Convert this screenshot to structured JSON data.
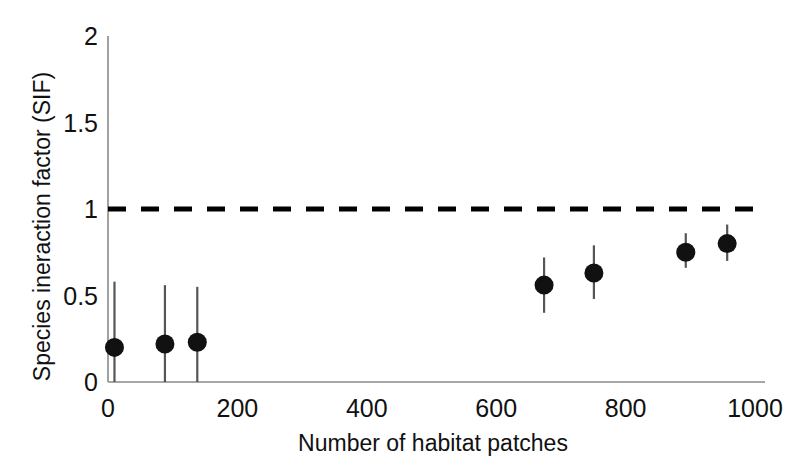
{
  "chart_data": {
    "type": "scatter",
    "title": "",
    "xlabel": "Number of habitat patches",
    "ylabel": "Species ineraction factor (SIF)",
    "xlim": [
      0,
      1000
    ],
    "ylim": [
      0,
      2
    ],
    "xticks": [
      0,
      200,
      400,
      600,
      800,
      1000
    ],
    "yticks": [
      0,
      0.5,
      1,
      1.5,
      2
    ],
    "xtick_labels": [
      "0",
      "200",
      "400",
      "600",
      "800",
      "1000"
    ],
    "ytick_labels": [
      "0",
      "0.5",
      "1",
      "1.5",
      "2"
    ],
    "grid": false,
    "legend": "none",
    "marker": "filled-circle",
    "marker_color": "#111111",
    "errorbar_color": "#555555",
    "axis_color": "#8a8a8a",
    "reference_line": {
      "label": "SIF = 1 (no interaction)",
      "orientation": "horizontal",
      "y": 1,
      "style": "dashed",
      "color": "#000000",
      "width": 5
    },
    "points": [
      {
        "x": 10,
        "y": 0.2,
        "y_low": 0.0,
        "y_high": 0.58
      },
      {
        "x": 88,
        "y": 0.22,
        "y_low": 0.0,
        "y_high": 0.56
      },
      {
        "x": 138,
        "y": 0.23,
        "y_low": 0.0,
        "y_high": 0.55
      },
      {
        "x": 674,
        "y": 0.56,
        "y_low": 0.4,
        "y_high": 0.72
      },
      {
        "x": 751,
        "y": 0.63,
        "y_low": 0.48,
        "y_high": 0.79
      },
      {
        "x": 893,
        "y": 0.75,
        "y_low": 0.66,
        "y_high": 0.86
      },
      {
        "x": 957,
        "y": 0.8,
        "y_low": 0.7,
        "y_high": 0.91
      }
    ],
    "series": [
      {
        "name": "SIF estimate",
        "x": [
          10,
          88,
          138,
          674,
          751,
          893,
          957
        ],
        "values": [
          0.2,
          0.22,
          0.23,
          0.56,
          0.63,
          0.75,
          0.8
        ],
        "error_low": [
          0.0,
          0.0,
          0.0,
          0.4,
          0.48,
          0.66,
          0.7
        ],
        "error_high": [
          0.58,
          0.56,
          0.55,
          0.72,
          0.79,
          0.86,
          0.91
        ]
      }
    ]
  }
}
